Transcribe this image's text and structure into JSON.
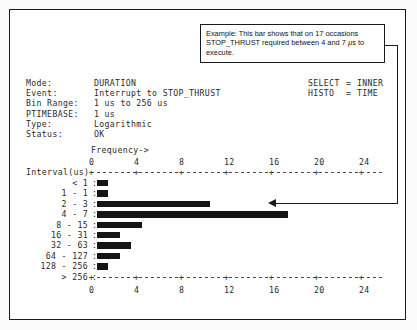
{
  "callout": {
    "line1": "Example: This bar shows that on 17 occasions",
    "line2_a": "STOP_THRUST required between 4 and 7 ",
    "line2_mu": "µ",
    "line2_b": "s to",
    "line3": "execute."
  },
  "meta": {
    "rows": [
      {
        "key": "Mode:",
        "value": "DURATION"
      },
      {
        "key": "Event:",
        "value": "Interrupt to STOP_THRUST"
      },
      {
        "key": "Bin Range:",
        "value": "1 us to 256 us"
      },
      {
        "key": "PTIMEBASE:",
        "value": "1 us"
      },
      {
        "key": "Type:",
        "value": "Logarithmic"
      },
      {
        "key": "Status:",
        "value": "OK"
      }
    ]
  },
  "meta_right": {
    "rows": [
      {
        "key": "SELECT",
        "eq": "=",
        "value": "INNER"
      },
      {
        "key": "HISTO",
        "eq": "=",
        "value": "TIME"
      }
    ]
  },
  "chart_labels": {
    "frequency_header": "Frequency->",
    "interval_header": "Interval(us)"
  },
  "chart_data": {
    "type": "bar",
    "title": "",
    "orientation": "horizontal",
    "xlabel": "Frequency->",
    "ylabel": "Interval(us)",
    "xlim": [
      0,
      26
    ],
    "ticks": [
      0,
      4,
      8,
      12,
      16,
      20,
      24
    ],
    "tick_labels": [
      "0",
      "4",
      "8",
      "12",
      "16",
      "20",
      "24"
    ],
    "grid": false,
    "legend": "none",
    "categories": [
      "< 1",
      "1 - 1",
      "2 - 3",
      "4 - 7",
      "8 - 15",
      "16 - 31",
      "32 - 63",
      "64 - 127",
      "128 - 256",
      "> 256"
    ],
    "values": [
      1,
      1,
      10,
      17,
      4,
      2,
      3,
      2,
      1,
      0
    ],
    "annotations": [
      {
        "target_category": "4 - 7",
        "text": "Example: This bar shows that on 17 occasions STOP_THRUST required between 4 and 7 µs to execute.",
        "value": 17
      }
    ]
  },
  "colors": {
    "bar": "#151515",
    "frame": "#1a1a1a",
    "text": "#2a2a2a",
    "background": "#ffffff"
  }
}
